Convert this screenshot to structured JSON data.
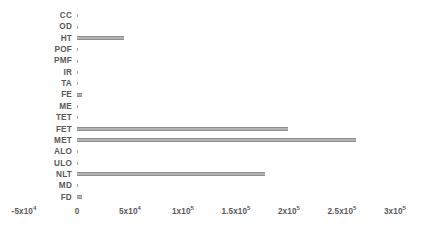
{
  "chart_data": {
    "type": "bar",
    "orientation": "horizontal",
    "title": "",
    "xlabel": "",
    "ylabel": "",
    "grid": false,
    "legend": null,
    "xlim": [
      -50000,
      300000
    ],
    "categories": [
      "CC",
      "OD",
      "HT",
      "POF",
      "PMF",
      "IR",
      "TA",
      "FE",
      "ME",
      "TET",
      "FET",
      "MET",
      "ALO",
      "ULO",
      "NLT",
      "MD",
      "FD"
    ],
    "values": [
      0,
      0,
      44000,
      0,
      0,
      0,
      0,
      5000,
      0,
      0,
      199000,
      263000,
      0,
      0,
      177000,
      0,
      5000
    ],
    "xticks": [
      -50000,
      0,
      50000,
      100000,
      150000,
      200000,
      250000,
      300000
    ],
    "xtick_labels": [
      "-5x10⁴",
      "0",
      "5x10⁴",
      "1x10⁵",
      "1.5x10⁵",
      "2x10⁵",
      "2.5x10⁵",
      "3x10⁵"
    ],
    "bar_color": "#b4b4b4",
    "bar_edge_color": "#8f8f8f",
    "text_color": "#595959",
    "background": "#ffffff"
  },
  "xticks_display": [
    {
      "label_main": "-5x10",
      "label_exp": "4",
      "value": -50000
    },
    {
      "label_main": "0",
      "label_exp": "",
      "value": 0
    },
    {
      "label_main": "5x10",
      "label_exp": "4",
      "value": 50000
    },
    {
      "label_main": "1x10",
      "label_exp": "5",
      "value": 100000
    },
    {
      "label_main": "1.5x10",
      "label_exp": "5",
      "value": 150000
    },
    {
      "label_main": "2x10",
      "label_exp": "5",
      "value": 200000
    },
    {
      "label_main": "2.5x10",
      "label_exp": "5",
      "value": 250000
    },
    {
      "label_main": "3x10",
      "label_exp": "5",
      "value": 300000
    }
  ]
}
